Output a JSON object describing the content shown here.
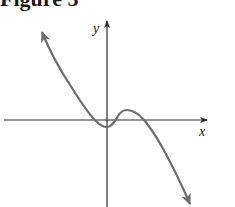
{
  "figure": {
    "title": "Figure 3",
    "x_label": "x",
    "y_label": "y",
    "colors": {
      "axes": "#2a2a2a",
      "curve": "#6e6e6e"
    }
  }
}
